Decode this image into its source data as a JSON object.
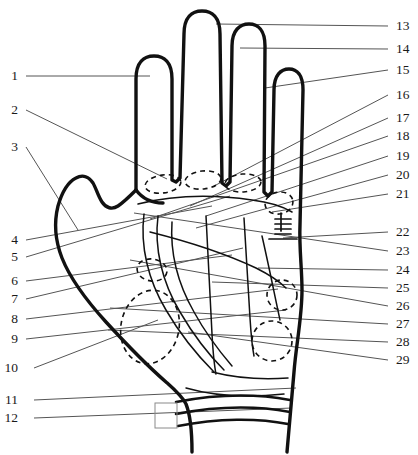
{
  "figure": {
    "background_color": "#ffffff",
    "outline_color": "#111111",
    "leader_line_color": "#4a4a4a",
    "dashed_color": "#111111",
    "width": 418,
    "height": 455
  },
  "labels": {
    "left": [
      {
        "id": "1",
        "text": "1",
        "x": 14,
        "y": 76,
        "leader": {
          "x1": 26,
          "y1": 76,
          "x2": 150,
          "y2": 76
        }
      },
      {
        "id": "2",
        "text": "2",
        "x": 14,
        "y": 110,
        "leader": {
          "x1": 26,
          "y1": 110,
          "x2": 167,
          "y2": 179
        }
      },
      {
        "id": "3",
        "text": "3",
        "x": 14,
        "y": 147,
        "leader": {
          "x1": 26,
          "y1": 147,
          "x2": 78,
          "y2": 230
        }
      },
      {
        "id": "4",
        "text": "4",
        "x": 14,
        "y": 240,
        "leader": {
          "x1": 26,
          "y1": 240,
          "x2": 212,
          "y2": 206
        }
      },
      {
        "id": "5",
        "text": "5",
        "x": 14,
        "y": 257,
        "leader": {
          "x1": 26,
          "y1": 257,
          "x2": 230,
          "y2": 196
        }
      },
      {
        "id": "6",
        "text": "6",
        "x": 14,
        "y": 281,
        "leader": {
          "x1": 26,
          "y1": 281,
          "x2": 232,
          "y2": 255
        }
      },
      {
        "id": "7",
        "text": "7",
        "x": 14,
        "y": 299,
        "leader": {
          "x1": 26,
          "y1": 299,
          "x2": 243,
          "y2": 248
        }
      },
      {
        "id": "8",
        "text": "8",
        "x": 14,
        "y": 319,
        "leader": {
          "x1": 26,
          "y1": 319,
          "x2": 278,
          "y2": 289
        }
      },
      {
        "id": "9",
        "text": "9",
        "x": 14,
        "y": 339,
        "leader": {
          "x1": 26,
          "y1": 339,
          "x2": 286,
          "y2": 310
        }
      },
      {
        "id": "10",
        "text": "10",
        "x": 14,
        "y": 368,
        "leader": {
          "x1": 34,
          "y1": 368,
          "x2": 158,
          "y2": 320
        }
      },
      {
        "id": "11",
        "text": "11",
        "x": 14,
        "y": 400,
        "leader": {
          "x1": 34,
          "y1": 400,
          "x2": 296,
          "y2": 388
        }
      },
      {
        "id": "12",
        "text": "12",
        "x": 14,
        "y": 418,
        "leader": {
          "x1": 34,
          "y1": 418,
          "x2": 292,
          "y2": 408
        }
      }
    ],
    "right": [
      {
        "id": "13",
        "text": "13",
        "x": 396,
        "y": 26,
        "leader": {
          "x1": 388,
          "y1": 26,
          "x2": 216,
          "y2": 24
        }
      },
      {
        "id": "14",
        "text": "14",
        "x": 396,
        "y": 49,
        "leader": {
          "x1": 388,
          "y1": 49,
          "x2": 240,
          "y2": 48
        }
      },
      {
        "id": "15",
        "text": "15",
        "x": 396,
        "y": 70,
        "leader": {
          "x1": 388,
          "y1": 70,
          "x2": 265,
          "y2": 88
        }
      },
      {
        "id": "16",
        "text": "16",
        "x": 396,
        "y": 95,
        "leader": {
          "x1": 388,
          "y1": 95,
          "x2": 214,
          "y2": 186
        }
      },
      {
        "id": "17",
        "text": "17",
        "x": 396,
        "y": 118,
        "leader": {
          "x1": 388,
          "y1": 118,
          "x2": 190,
          "y2": 206
        }
      },
      {
        "id": "18",
        "text": "18",
        "x": 396,
        "y": 136,
        "leader": {
          "x1": 388,
          "y1": 136,
          "x2": 150,
          "y2": 219
        }
      },
      {
        "id": "19",
        "text": "19",
        "x": 396,
        "y": 156,
        "leader": {
          "x1": 388,
          "y1": 156,
          "x2": 206,
          "y2": 216
        }
      },
      {
        "id": "20",
        "text": "20",
        "x": 396,
        "y": 175,
        "leader": {
          "x1": 388,
          "y1": 175,
          "x2": 196,
          "y2": 228
        }
      },
      {
        "id": "21",
        "text": "21",
        "x": 396,
        "y": 194,
        "leader": {
          "x1": 388,
          "y1": 194,
          "x2": 272,
          "y2": 212
        }
      },
      {
        "id": "22",
        "text": "22",
        "x": 396,
        "y": 232,
        "leader": {
          "x1": 388,
          "y1": 232,
          "x2": 283,
          "y2": 238
        }
      },
      {
        "id": "23",
        "text": "23",
        "x": 396,
        "y": 251,
        "leader": {
          "x1": 388,
          "y1": 251,
          "x2": 134,
          "y2": 213
        }
      },
      {
        "id": "24",
        "text": "24",
        "x": 396,
        "y": 270,
        "leader": {
          "x1": 388,
          "y1": 270,
          "x2": 258,
          "y2": 268
        }
      },
      {
        "id": "25",
        "text": "25",
        "x": 396,
        "y": 288,
        "leader": {
          "x1": 388,
          "y1": 288,
          "x2": 212,
          "y2": 282
        }
      },
      {
        "id": "26",
        "text": "26",
        "x": 396,
        "y": 306,
        "leader": {
          "x1": 388,
          "y1": 306,
          "x2": 130,
          "y2": 260
        }
      },
      {
        "id": "27",
        "text": "27",
        "x": 396,
        "y": 324,
        "leader": {
          "x1": 388,
          "y1": 324,
          "x2": 110,
          "y2": 308
        }
      },
      {
        "id": "28",
        "text": "28",
        "x": 396,
        "y": 342,
        "leader": {
          "x1": 388,
          "y1": 342,
          "x2": 108,
          "y2": 330
        }
      },
      {
        "id": "29",
        "text": "29",
        "x": 396,
        "y": 360,
        "leader": {
          "x1": 388,
          "y1": 360,
          "x2": 188,
          "y2": 332
        }
      }
    ]
  },
  "markers": {
    "finger_base_ellipses": [
      {
        "name": "mount-index",
        "cx": 163,
        "cy": 184,
        "rx": 18,
        "ry": 9,
        "rot": -8
      },
      {
        "name": "mount-middle",
        "cx": 203,
        "cy": 180,
        "rx": 18,
        "ry": 9,
        "rot": -6
      },
      {
        "name": "mount-ring",
        "cx": 243,
        "cy": 183,
        "rx": 18,
        "ry": 9,
        "rot": -4
      }
    ],
    "small_circles": [
      {
        "name": "mount-little",
        "cx": 279,
        "cy": 203,
        "rx": 14,
        "ry": 11,
        "rot": -10
      },
      {
        "name": "mount-thenar-upper",
        "cx": 152,
        "cy": 270,
        "rx": 15,
        "ry": 11,
        "rot": 8
      },
      {
        "name": "mount-luna-upper",
        "cx": 282,
        "cy": 295,
        "rx": 15,
        "ry": 15,
        "rot": 0
      },
      {
        "name": "mount-luna-lower",
        "cx": 272,
        "cy": 341,
        "rx": 20,
        "ry": 20,
        "rot": 0
      }
    ],
    "large_ellipse": {
      "name": "mount-venus",
      "cx": 150,
      "cy": 327,
      "rx": 29,
      "ry": 37,
      "rot": 12
    },
    "wrist_rect": {
      "name": "wrist-marker-box",
      "x": 155,
      "y": 403,
      "w": 22,
      "h": 25
    },
    "hatch_marks": {
      "name": "hatch-tick-group",
      "x": 283,
      "y": 219,
      "count": 5
    }
  }
}
